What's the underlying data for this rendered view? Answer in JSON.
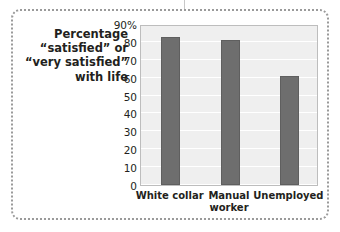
{
  "caption": {
    "lines": [
      "Percentage",
      "“satisfied” or",
      "“very satisfied”",
      "with life"
    ]
  },
  "colors": {
    "bar_fill": "#6e6e6e",
    "bar_edge": "#5f5f5f",
    "plot_background": "#efefef",
    "gridline": "#ffffff",
    "plot_border": "#bdbdbd",
    "frame_border": "#9a9a9a",
    "text": "#231f20",
    "page_background": "#ffffff"
  },
  "chart_data": {
    "type": "bar",
    "title": "",
    "xlabel": "",
    "ylabel": "Percentage “satisfied” or “very satisfied” with life",
    "categories": [
      "White collar",
      "Manual worker",
      "Unemployed"
    ],
    "values": [
      83,
      81,
      61
    ],
    "ylim": [
      0,
      90
    ],
    "yticks": [
      0,
      10,
      20,
      30,
      40,
      50,
      60,
      70,
      80,
      90
    ],
    "ytick_labels": [
      "0",
      "10",
      "20",
      "30",
      "40",
      "50",
      "60",
      "70",
      "80",
      "90%"
    ],
    "grid": true,
    "legend": null,
    "series": [
      {
        "name": "Percentage satisfied or very satisfied with life",
        "values": [
          83,
          81,
          61
        ]
      }
    ]
  }
}
